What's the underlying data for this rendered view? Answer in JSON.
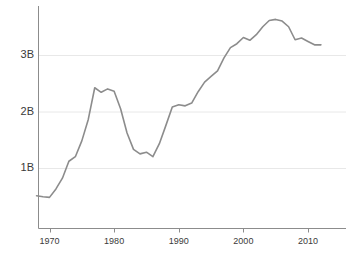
{
  "chart_data": {
    "type": "line",
    "title": "",
    "subtitle": "",
    "xlabel": "",
    "ylabel": "",
    "xlim": [
      1968,
      2012
    ],
    "ylim": [
      0,
      3.95
    ],
    "grid": "horizontal",
    "legend": "none",
    "y_tick_labels": [
      "1B",
      "2B",
      "3B"
    ],
    "y_tick_values": [
      1,
      2,
      3
    ],
    "x_tick_labels": [
      "1970",
      "1980",
      "1990",
      "2000",
      "2010"
    ],
    "x_tick_values": [
      1970,
      1980,
      1990,
      2000,
      2010
    ],
    "line_color": "#8c8c8c",
    "grid_color": "#e8e8e8",
    "axis_color": "#8c8c8c",
    "units": "billions",
    "series": [
      {
        "name": "value",
        "x": [
          1968,
          1969,
          1970,
          1971,
          1972,
          1973,
          1974,
          1975,
          1976,
          1977,
          1978,
          1979,
          1980,
          1981,
          1982,
          1983,
          1984,
          1985,
          1986,
          1987,
          1988,
          1989,
          1990,
          1991,
          1992,
          1993,
          1994,
          1995,
          1996,
          1997,
          1998,
          1999,
          2000,
          2001,
          2002,
          2003,
          2004,
          2005,
          2006,
          2007,
          2008,
          2009,
          2010,
          2011,
          2012
        ],
        "values": [
          0.51,
          0.49,
          0.48,
          0.63,
          0.82,
          1.12,
          1.2,
          1.48,
          1.86,
          2.42,
          2.34,
          2.4,
          2.36,
          2.05,
          1.62,
          1.33,
          1.25,
          1.28,
          1.2,
          1.43,
          1.75,
          2.08,
          2.12,
          2.1,
          2.15,
          2.35,
          2.52,
          2.62,
          2.72,
          2.95,
          3.13,
          3.2,
          3.31,
          3.26,
          3.36,
          3.5,
          3.61,
          3.63,
          3.6,
          3.5,
          3.27,
          3.3,
          3.24,
          3.18,
          3.18
        ]
      }
    ]
  },
  "axes": {
    "y_ticks": [
      {
        "label": "1B",
        "value": 1
      },
      {
        "label": "2B",
        "value": 2
      },
      {
        "label": "3B",
        "value": 3
      }
    ],
    "x_ticks": [
      {
        "label": "1970",
        "value": 1970
      },
      {
        "label": "1980",
        "value": 1980
      },
      {
        "label": "1990",
        "value": 1990
      },
      {
        "label": "2000",
        "value": 2000
      },
      {
        "label": "2010",
        "value": 2010
      }
    ]
  }
}
